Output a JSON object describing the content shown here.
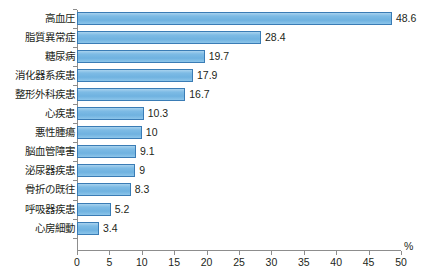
{
  "chart_data": {
    "type": "bar",
    "orientation": "horizontal",
    "title": "",
    "subtitle": "",
    "xlabel": "%",
    "ylabel": "",
    "categories": [
      "高血圧",
      "脂質異常症",
      "糖尿病",
      "消化器系疾患",
      "整形外科疾患",
      "心疾患",
      "悪性腫瘍",
      "脳血管障害",
      "泌尿器疾患",
      "骨折の既往",
      "呼吸器疾患",
      "心房細動"
    ],
    "values": [
      48.6,
      28.4,
      19.7,
      17.9,
      16.7,
      10.3,
      10,
      9.1,
      9,
      8.3,
      5.2,
      3.4
    ],
    "value_labels": [
      "48.6",
      "28.4",
      "19.7",
      "17.9",
      "16.7",
      "10.3",
      "10",
      "9.1",
      "9",
      "8.3",
      "5.2",
      "3.4"
    ],
    "xlim": [
      0,
      50
    ],
    "xticks": [
      0,
      5,
      10,
      15,
      20,
      25,
      30,
      35,
      40,
      45,
      50
    ],
    "xtick_labels": [
      "0",
      "5",
      "10",
      "15",
      "20",
      "25",
      "30",
      "35",
      "40",
      "45",
      "50"
    ],
    "grid": false,
    "legend": null,
    "legend_position": "none",
    "colors": {
      "bar_fill": "#77b8e3",
      "bar_fill_light": "#a8d2ee",
      "bar_border": "#3a7cb5",
      "axis": "#8d8d8d",
      "text": "#231f20",
      "background": "#ffffff"
    }
  }
}
